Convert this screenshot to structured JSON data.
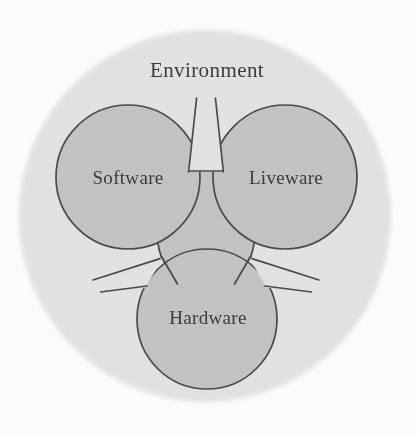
{
  "diagram": {
    "title_label": "Environment",
    "type": "venn-like-three-node-system-diagram",
    "nodes": [
      {
        "id": "software",
        "label": "Software",
        "cx": 128,
        "cy": 177,
        "r": 72
      },
      {
        "id": "liveware",
        "label": "Liveware",
        "cx": 285,
        "cy": 177,
        "r": 72
      },
      {
        "id": "hardware",
        "label": "Hardware",
        "cx": 207,
        "cy": 319,
        "r": 70
      }
    ],
    "container": {
      "id": "environment",
      "label": "Environment",
      "cx": 205,
      "cy": 216,
      "r": 187,
      "label_x": 207,
      "label_y": 72
    },
    "center_region": {
      "id": "core-interaction-zone",
      "cx": 206,
      "cy": 221
    },
    "colors": {
      "page_background": "#fdfdfd",
      "environment_fill": "#e3e3e3",
      "node_fill": "#c4c4c4",
      "node_stroke": "#4a4a4a",
      "center_fill": "#c4c4c4",
      "center_stroke": "#4a4a4a",
      "text": "#3b3b3b"
    }
  }
}
